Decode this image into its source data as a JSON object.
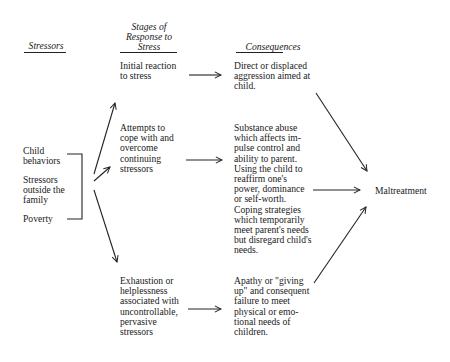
{
  "headers": {
    "stressors": "Stressors",
    "stages": "Stages of\nResponse to\nStress",
    "consequences": "Consequences"
  },
  "stressors": {
    "child_behaviors": "Child\nbehaviors",
    "outside_family": "Stressors\noutside the\nfamily",
    "poverty": "Poverty"
  },
  "stages": {
    "initial": "Initial reaction\nto stress",
    "cope": "Attempts to\ncope with and\novercome\ncontinuing\nstressors",
    "exhaustion": "Exhaustion or\nhelplessness\nassociated with\nuncontrollable,\npervasive\nstressors"
  },
  "consequences": {
    "aggression": "Direct or displaced\naggression aimed at\nchild.",
    "substance": "Substance abuse\nwhich affects im-\npulse control and\nability to parent.\nUsing the child to\nreaffirm one's\npower, dominance\nor self-worth.\nCoping strategies\nwhich temporarily\nmeet parent's needs\nbut disregard child's\nneeds.",
    "apathy": "Apathy or \"giving\nup\" and consequent\nfailure to meet\nphysical or emo-\ntional needs of\nchildren."
  },
  "outcome": "Maltreatment"
}
